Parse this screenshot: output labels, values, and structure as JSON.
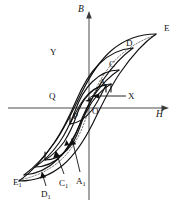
{
  "figure": {
    "background_color": "#ffffff",
    "curve_color": "#111111",
    "axis_color": "#4a4a4a",
    "virgin_curve_color": "#6b6b6b"
  },
  "axes": {
    "vertical": {
      "label": "B",
      "direction": "up",
      "x": 89,
      "top": 14,
      "bottom": 200
    },
    "horizontal": {
      "label": "H",
      "direction": "right",
      "y": 108,
      "left": 8,
      "right": 168
    }
  },
  "labels": [
    {
      "id": "B",
      "text": "B",
      "sub": "",
      "italic": true,
      "x": 79,
      "y": 8
    },
    {
      "id": "H",
      "text": "H",
      "sub": "",
      "italic": true,
      "x": 157,
      "y": 113
    },
    {
      "id": "E",
      "text": "E",
      "sub": "",
      "italic": false,
      "x": 164,
      "y": 25
    },
    {
      "id": "D",
      "text": "D",
      "sub": "",
      "italic": false,
      "x": 126,
      "y": 40
    },
    {
      "id": "C",
      "text": "C",
      "sub": "",
      "italic": false,
      "x": 109,
      "y": 61
    },
    {
      "id": "A",
      "text": "A",
      "sub": "",
      "italic": false,
      "x": 99,
      "y": 79
    },
    {
      "id": "Y",
      "text": "Y",
      "sub": "",
      "italic": false,
      "x": 50,
      "y": 49
    },
    {
      "id": "Q",
      "text": "Q",
      "sub": "",
      "italic": false,
      "x": 49,
      "y": 93
    },
    {
      "id": "X",
      "text": "X",
      "sub": "",
      "italic": false,
      "x": 128,
      "y": 93
    },
    {
      "id": "O",
      "text": "O",
      "sub": "",
      "italic": false,
      "x": 92,
      "y": 107
    },
    {
      "id": "P",
      "text": "P",
      "sub": "",
      "italic": false,
      "x": 73,
      "y": 112
    },
    {
      "id": "E1",
      "text": "E",
      "sub": "1",
      "italic": false,
      "x": 14,
      "y": 178
    },
    {
      "id": "D1",
      "text": "D",
      "sub": "1",
      "italic": false,
      "x": 42,
      "y": 190
    },
    {
      "id": "C1",
      "text": "C",
      "sub": "1",
      "italic": false,
      "x": 59,
      "y": 180
    },
    {
      "id": "A1",
      "text": "A",
      "sub": "1",
      "italic": false,
      "x": 77,
      "y": 178
    }
  ],
  "curves": {
    "loop_E": {
      "name": "outer-major-loop",
      "vertices": [
        "E",
        "E1"
      ],
      "description": "largest hysteresis loop, saturation points E (upper right) and E1 (lower left)"
    },
    "loop_D": {
      "name": "minor-loop-D",
      "vertices": [
        "D",
        "D1"
      ],
      "description": "second largest nested loop"
    },
    "loop_C": {
      "name": "minor-loop-C",
      "vertices": [
        "C",
        "C1"
      ],
      "description": "third nested loop"
    },
    "loop_A": {
      "name": "minor-loop-A",
      "vertices": [
        "A",
        "A1"
      ],
      "description": "fourth nested loop"
    },
    "loop_P": {
      "name": "innermost-loop-PA",
      "vertices": [
        "P",
        "A"
      ],
      "description": "smallest lens-shaped loop through origin region"
    },
    "virgin_curve": {
      "name": "initial-magnetization-curve",
      "style": "dotted",
      "description": "dotted initial magnetization curve from E1 through O to E"
    }
  },
  "annotations": {
    "x_leader": "arrow from X label pointing left to loop branch",
    "direction_arrows": "small arrows on lower branches indicating traversal direction"
  }
}
